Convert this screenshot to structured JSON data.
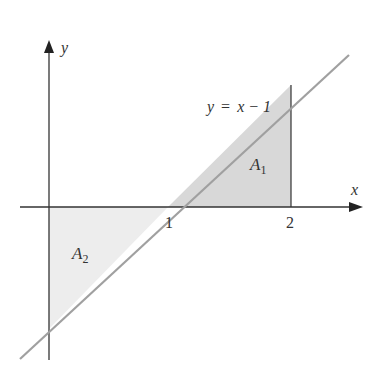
{
  "diagram": {
    "axes": {
      "x_label": "x",
      "y_label": "y"
    },
    "ticks": {
      "x1": "1",
      "x2": "2"
    },
    "line": {
      "equation_lhs": "y",
      "equation_eq": "=",
      "equation_rhs": "x − 1"
    },
    "regions": {
      "a1_base": "A",
      "a1_sub": "1",
      "a2_base": "A",
      "a2_sub": "2"
    },
    "colors": {
      "axis": "#333333",
      "line": "#9a9a9a",
      "fill_a1": "#d9d9d9",
      "fill_a2": "#ececec"
    }
  }
}
